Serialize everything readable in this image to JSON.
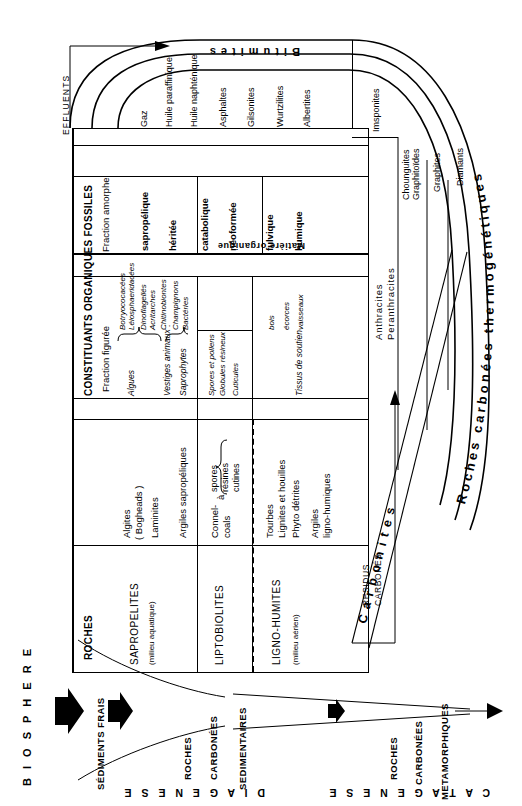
{
  "diagram": {
    "title_curved_outer": "Roches carbonées thermogénétiques",
    "title_curved_inner": "Carbonites",
    "bitumites_band": "Bitumites",
    "effluents_label": "EFFLUENTS",
    "residus_label_line1": "RESIDUS",
    "residus_label_line2": "CARBONÉS",
    "matiere_organique": "Matière organique"
  },
  "table": {
    "headers": {
      "roches": "ROCHES",
      "constituants": "CONSTITUANTS  ORGANIQUES  FOSSILES",
      "fraction_figuree": "Fraction  figurée",
      "fraction_amorphe": "Fraction amorphe"
    },
    "rows": [
      {
        "family": "SAPROPELITES",
        "milieu": "(milieu aquatique)",
        "roches": [
          "Algites",
          "( Bogheads )",
          "Laminites",
          "Argiles sapropéliques"
        ],
        "figuree_main": [
          "Algues",
          "Vestiges animaux :",
          "Saprophytes"
        ],
        "figuree_detail": [
          "Botryococacées",
          "Léiosphaeridacées",
          "Dinoflagellés",
          "Acritarches",
          "Chitinobiontes",
          "Champignons",
          "Bactéries"
        ],
        "amorphe": [
          "sapropélique",
          "héritée"
        ]
      },
      {
        "family": "LIPTOBIOLITES",
        "milieu": "",
        "roches": [
          "Connel-",
          "coals",
          "à",
          "spores",
          "résines",
          "cutines"
        ],
        "figuree_main": [],
        "figuree_detail": [
          "Spores et pollens",
          "Globules résineux",
          "Cuticules"
        ],
        "amorphe": [
          "catabolique",
          "néoformée"
        ]
      },
      {
        "family": "LIGNO-HUMITES",
        "milieu": "(milieu aérien)",
        "roches": [
          "Tourbes",
          "Lignites et houilles",
          "Phyto détrites",
          "Argiles",
          "ligno-humiques"
        ],
        "figuree_main": [
          "Tissus de soutien"
        ],
        "figuree_detail": [
          "bois",
          "écorces",
          "vaisseaux"
        ],
        "amorphe": [
          "fulvique",
          "humique"
        ]
      }
    ],
    "bitumites_products": [
      "Gaz",
      "Huile paraffinique",
      "Huile naphténique",
      "Asphaltes",
      "Gilsonites",
      "Wurtzilites",
      "Albertites"
    ],
    "residual_products": [
      "Imsponites"
    ],
    "carbonites_products": [
      "Anthracites",
      "Peranthracites"
    ],
    "graphite_products": [
      "Chounguites",
      "Graphitoïdes",
      "Graphites",
      "Diamants"
    ]
  },
  "bottom_diagram": {
    "biosphere": "B I O S P H E R E",
    "sediments_frais": "SÉDIMENTS FRAIS",
    "stage_1": [
      "ROCHES",
      "CARBONÉES",
      "SEDIMENTAIRES"
    ],
    "stage_2": [
      "ROCHES",
      "CARBONÉES",
      "METAMORPHIQUES"
    ],
    "diagenese": "D I A G E N E S E",
    "catagenese": "C A T A G E N E S E"
  }
}
